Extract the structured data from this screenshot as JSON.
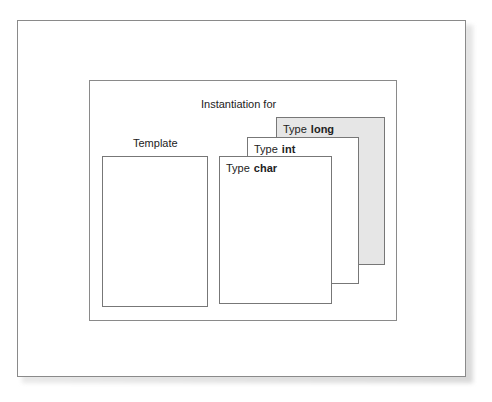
{
  "diagram": {
    "instantiation_title": "Instantiation for",
    "template_label": "Template",
    "instances": [
      {
        "prefix": "Type",
        "type": "char"
      },
      {
        "prefix": "Type",
        "type": "int"
      },
      {
        "prefix": "Type",
        "type": "long"
      }
    ],
    "colors": {
      "long_fill": "#e6e6e6",
      "border": "#8a8a8a"
    }
  }
}
